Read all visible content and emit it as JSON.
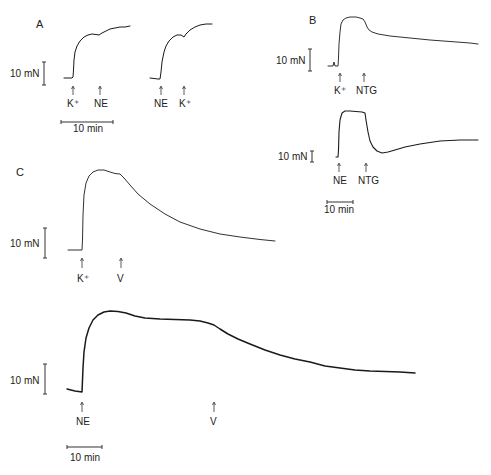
{
  "figure": {
    "panels": [
      {
        "id": "A",
        "label": "A",
        "force_scale": "10 mN",
        "time_scale": "10 min",
        "traces": [
          {
            "name": "A-trace-1",
            "events": [
              {
                "label": "K⁺"
              },
              {
                "label": "NE"
              }
            ]
          },
          {
            "name": "A-trace-2",
            "events": [
              {
                "label": "NE"
              },
              {
                "label": "K⁺"
              }
            ]
          }
        ]
      },
      {
        "id": "B",
        "label": "B",
        "force_scale": "10 mN",
        "time_scale": "10 min",
        "traces": [
          {
            "name": "B-trace-1",
            "events": [
              {
                "label": "K⁺"
              },
              {
                "label": "NTG"
              }
            ]
          },
          {
            "name": "B-trace-2",
            "events": [
              {
                "label": "NE"
              },
              {
                "label": "NTG"
              }
            ]
          }
        ]
      },
      {
        "id": "C",
        "label": "C",
        "force_scale": "10 mN",
        "time_scale": "10 min",
        "traces": [
          {
            "name": "C-trace-1",
            "events": [
              {
                "label": "K⁺"
              },
              {
                "label": "V"
              }
            ]
          },
          {
            "name": "C-trace-2",
            "events": [
              {
                "label": "NE"
              },
              {
                "label": "V"
              }
            ]
          }
        ]
      }
    ]
  },
  "labels": {
    "A": "A",
    "B": "B",
    "C": "C",
    "mn": "10 mN",
    "min": "10 min",
    "K": "K⁺",
    "NE": "NE",
    "NTG": "NTG",
    "V": "V"
  }
}
